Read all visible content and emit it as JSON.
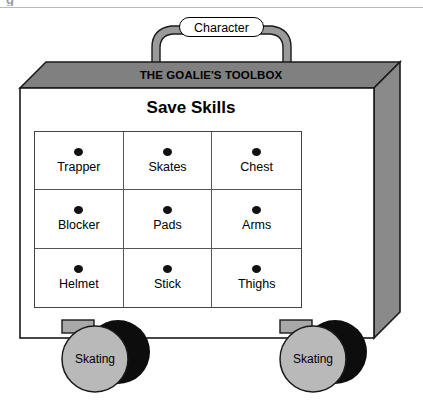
{
  "figure": {
    "clipped_glyph": "g",
    "handle_badge": "Character",
    "lid_title": "THE GOALIE'S TOOLBOX",
    "section_heading": "Save Skills"
  },
  "drawers": [
    {
      "label": "Trapper",
      "knob": "drawer-knob"
    },
    {
      "label": "Skates",
      "knob": "drawer-knob"
    },
    {
      "label": "Chest",
      "knob": "drawer-knob"
    },
    {
      "label": "Blocker",
      "knob": "drawer-knob"
    },
    {
      "label": "Pads",
      "knob": "drawer-knob"
    },
    {
      "label": "Arms",
      "knob": "drawer-knob"
    },
    {
      "label": "Helmet",
      "knob": "drawer-knob"
    },
    {
      "label": "Stick",
      "knob": "drawer-knob"
    },
    {
      "label": "Thighs",
      "knob": "drawer-knob"
    }
  ],
  "wheels": [
    {
      "label": "Skating"
    },
    {
      "label": "Skating"
    }
  ],
  "colors": {
    "lid_gray": "#808080",
    "side_gray": "#8a8a8a",
    "handle_gray": "#9a9a9a",
    "wheel_gray": "#b9b9b9",
    "bracket_gray": "#a8a8a8",
    "shadow_black": "#0d0d0d",
    "outline": "#1a1a1a",
    "body_white": "#ffffff",
    "top_rule": "#b9b9b9"
  }
}
